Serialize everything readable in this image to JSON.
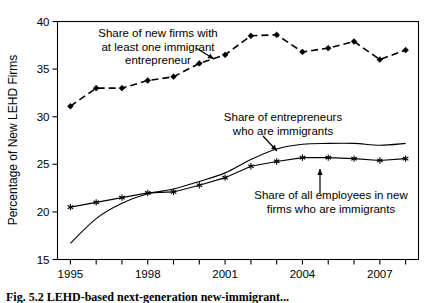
{
  "figure": {
    "caption": "Fig. 5.2   LEHD-based next-generation new-immigrant...",
    "background": "#ffffff",
    "ink_color": "#000000"
  },
  "chart_data": {
    "type": "line",
    "title": "",
    "subtitle": "",
    "xlabel": "",
    "ylabel": "Percentage of New LEHD Firms",
    "xlim": [
      1994.5,
      2008.5
    ],
    "ylim": [
      15,
      40
    ],
    "y_ticks": [
      15,
      20,
      25,
      30,
      35,
      40
    ],
    "y_tick_labels": [
      "15",
      "20",
      "25",
      "30",
      "35",
      "40"
    ],
    "x_ticks": [
      1995,
      1996,
      1997,
      1998,
      1999,
      2000,
      2001,
      2002,
      2003,
      2004,
      2005,
      2006,
      2007,
      2008
    ],
    "x_tick_labels_shown": [
      "1995",
      "1998",
      "2001",
      "2004",
      "2007"
    ],
    "x_labelled_ticks": [
      1995,
      1998,
      2001,
      2004,
      2007
    ],
    "grid": false,
    "legend_position": "none",
    "x": [
      1995,
      1996,
      1997,
      1998,
      1999,
      2000,
      2001,
      2002,
      2003,
      2004,
      2005,
      2006,
      2007,
      2008
    ],
    "series": [
      {
        "name": "Share of new firms with at least one immigrant entrepreneur",
        "style": "dashed",
        "marker": "diamond",
        "values": [
          31.1,
          33.0,
          33.0,
          33.8,
          34.2,
          35.6,
          36.5,
          38.5,
          38.6,
          36.8,
          37.2,
          37.9,
          36.0,
          37.0
        ]
      },
      {
        "name": "Share of entrepreneurs who are immigrants",
        "style": "solid",
        "marker": "none",
        "values": [
          16.7,
          19.3,
          20.9,
          21.9,
          22.4,
          23.2,
          24.1,
          25.5,
          26.6,
          27.1,
          27.2,
          27.2,
          27.0,
          27.2
        ]
      },
      {
        "name": "Share of all employees in new firms who are immigrants",
        "style": "solid",
        "marker": "asterisk",
        "values": [
          20.5,
          21.0,
          21.5,
          22.0,
          22.1,
          22.8,
          23.6,
          24.8,
          25.3,
          25.7,
          25.7,
          25.6,
          25.4,
          25.6
        ]
      }
    ],
    "annotations": [
      {
        "id": "annotation-top",
        "lines": [
          "Share of new firms with",
          "at least one immigrant",
          "entrepreneur"
        ],
        "text_anchor_x": 158,
        "text_anchor_y": 37,
        "arrow_from": [
          196,
          48
        ],
        "arrow_to": [
          214,
          59
        ]
      },
      {
        "id": "annotation-middle",
        "lines": [
          "Share of entrepreneurs",
          "who are immigrants"
        ],
        "text_anchor_x": 283,
        "text_anchor_y": 121,
        "arrow_from": [
          263,
          136
        ],
        "arrow_to": [
          277,
          151
        ]
      },
      {
        "id": "annotation-bottom",
        "lines": [
          "Share of all employees in new",
          "firms who are immigrants"
        ],
        "text_anchor_x": 331,
        "text_anchor_y": 199,
        "arrow_from": [
          320,
          193
        ],
        "arrow_to": [
          320,
          169
        ]
      }
    ]
  }
}
